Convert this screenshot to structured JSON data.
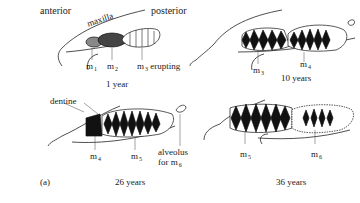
{
  "figure": {
    "panel_label": "(a)",
    "orientation": {
      "left": "anterior",
      "right": "posterior"
    },
    "bone_label": "maxilla",
    "panels": [
      {
        "id": "age-1",
        "age_label": "1 year",
        "teeth": [
          {
            "label": "m",
            "sub": "1"
          },
          {
            "label": "m",
            "sub": "2"
          },
          {
            "label": "m",
            "sub": "3",
            "note": "erupting"
          }
        ]
      },
      {
        "id": "age-10",
        "age_label": "10 years",
        "teeth": [
          {
            "label": "m",
            "sub": "3"
          },
          {
            "label": "m",
            "sub": "4"
          }
        ]
      },
      {
        "id": "age-26",
        "age_label": "26 years",
        "annotation": "dentine",
        "teeth": [
          {
            "label": "m",
            "sub": "4"
          },
          {
            "label": "m",
            "sub": "5"
          }
        ],
        "alveolus_label_line1": "alveolus",
        "alveolus_label_line2": "for m",
        "alveolus_sub": "6"
      },
      {
        "id": "age-36",
        "age_label": "36 years",
        "teeth": [
          {
            "label": "m",
            "sub": "5"
          },
          {
            "label": "m",
            "sub": "6"
          }
        ]
      }
    ]
  }
}
